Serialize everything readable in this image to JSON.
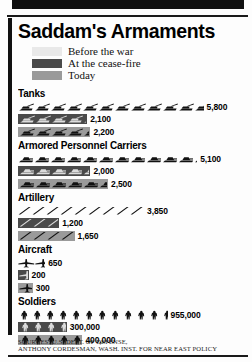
{
  "title": "Saddam's Armaments",
  "colors": {
    "before_the_war": "#e9e9e9",
    "at_the_cease_fire": "#4a4a4a",
    "today": "#9a9a9a",
    "ink": "#111111",
    "paper": "#fdfdfd"
  },
  "legend": {
    "items": [
      {
        "label": "Before the war",
        "color": "#e9e9e9",
        "swatch_name": "legend-swatch-before-the-war"
      },
      {
        "label": "At the cease-fire",
        "color": "#4a4a4a",
        "swatch_name": "legend-swatch-at-the-cease-fire"
      },
      {
        "label": "Today",
        "color": "#9a9a9a",
        "swatch_name": "legend-swatch-today"
      }
    ]
  },
  "sources": {
    "line1": "SOURCES: U.S. DEPT. OF DEFENSE,",
    "line2": "ANTHONY CORDESMAN, WASH. INST. FOR NEAR EAST POLICY"
  },
  "chart_data": {
    "type": "bar",
    "title": "Saddam's Armaments",
    "subtype": "pictograph",
    "xlabel": "",
    "ylabel": "",
    "grid": false,
    "legend_position": "top-left",
    "series": [
      {
        "name": "Before the war",
        "color": "#e9e9e9",
        "values": [
          5800,
          5100,
          3850,
          650,
          955000
        ]
      },
      {
        "name": "At the cease-fire",
        "color": "#4a4a4a",
        "values": [
          2100,
          2000,
          1200,
          200,
          300000
        ]
      },
      {
        "name": "Today",
        "color": "#9a9a9a",
        "values": [
          2200,
          2500,
          1650,
          300,
          400000
        ]
      }
    ],
    "categories": [
      "Tanks",
      "Armored Personnel Carriers",
      "Artillery",
      "Aircraft",
      "Soldiers"
    ],
    "groups": [
      {
        "category": "Tanks",
        "icon": "tank-icon",
        "rows": [
          {
            "series": "Before the war",
            "value": 5800,
            "label": "5,800",
            "icons": 11.6,
            "color": "#e9e9e9"
          },
          {
            "series": "At the cease-fire",
            "value": 2100,
            "label": "2,100",
            "icons": 4.2,
            "color": "#4a4a4a"
          },
          {
            "series": "Today",
            "value": 2200,
            "label": "2,200",
            "icons": 4.4,
            "color": "#9a9a9a"
          }
        ]
      },
      {
        "category": "Armored Personnel Carriers",
        "icon": "apc-icon",
        "rows": [
          {
            "series": "Before the war",
            "value": 5100,
            "label": "5,100",
            "icons": 11.2,
            "color": "#e9e9e9"
          },
          {
            "series": "At the cease-fire",
            "value": 2000,
            "label": "2,000",
            "icons": 4.4,
            "color": "#4a4a4a"
          },
          {
            "series": "Today",
            "value": 2500,
            "label": "2,500",
            "icons": 5.5,
            "color": "#9a9a9a"
          }
        ]
      },
      {
        "category": "Artillery",
        "icon": "artillery-icon",
        "rows": [
          {
            "series": "Before the war",
            "value": 3850,
            "label": "3,850",
            "icons": 9.0,
            "color": "#e9e9e9"
          },
          {
            "series": "At the cease-fire",
            "value": 1200,
            "label": "1,200",
            "icons": 2.8,
            "color": "#4a4a4a"
          },
          {
            "series": "Today",
            "value": 1650,
            "label": "1,650",
            "icons": 3.9,
            "color": "#9a9a9a"
          }
        ]
      },
      {
        "category": "Aircraft",
        "icon": "aircraft-icon",
        "rows": [
          {
            "series": "Before the war",
            "value": 650,
            "label": "650",
            "icons": 1.6,
            "color": "#e9e9e9"
          },
          {
            "series": "At the cease-fire",
            "value": 200,
            "label": "200",
            "icons": 0.5,
            "color": "#4a4a4a"
          },
          {
            "series": "Today",
            "value": 300,
            "label": "300",
            "icons": 0.75,
            "color": "#9a9a9a"
          }
        ]
      },
      {
        "category": "Soldiers",
        "icon": "soldier-icon",
        "rows": [
          {
            "series": "Before the war",
            "value": 955000,
            "label": "955,000",
            "icons": 11.5,
            "color": "#e9e9e9"
          },
          {
            "series": "At the cease-fire",
            "value": 300000,
            "label": "300,000",
            "icons": 3.6,
            "color": "#4a4a4a"
          },
          {
            "series": "Today",
            "value": 400000,
            "label": "400,000",
            "icons": 4.8,
            "color": "#9a9a9a"
          }
        ]
      }
    ]
  }
}
